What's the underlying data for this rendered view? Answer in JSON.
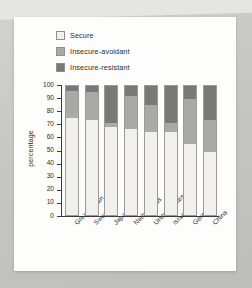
{
  "chart_data": {
    "type": "bar",
    "subtype": "stacked-100-percent",
    "title": "",
    "xlabel": "",
    "ylabel": "percentage",
    "ylim": [
      0,
      100
    ],
    "ytick_step": 10,
    "yticks": [
      100,
      90,
      80,
      70,
      60,
      50,
      40,
      30,
      20,
      10,
      0
    ],
    "grid": false,
    "legend_position": "top-left",
    "categories": [
      "Great Britain",
      "Sweden",
      "Japan",
      "Netherlands",
      "United States",
      "Israel",
      "Germany",
      "China"
    ],
    "series": [
      {
        "name": "Secure",
        "color": "#f1f0ec",
        "values": [
          75,
          74,
          68,
          67,
          64,
          64,
          55,
          49
        ]
      },
      {
        "name": "Insecure-avoidant",
        "color": "#a9a9a7",
        "values": [
          21,
          21,
          3,
          25,
          21,
          7,
          35,
          25
        ]
      },
      {
        "name": "Insecure-resistant",
        "color": "#797977",
        "values": [
          4,
          5,
          29,
          8,
          15,
          29,
          10,
          26
        ]
      }
    ]
  },
  "colors": {
    "page_background": "#c9c9c7",
    "card_background": "#fdfdfc",
    "axis": "#3a3a3a",
    "text": "#2a2a2a",
    "bar_border": "#9a9a9a"
  }
}
